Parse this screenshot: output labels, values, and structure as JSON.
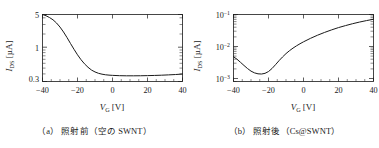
{
  "figure": {
    "panels": [
      {
        "id": "a",
        "caption_tag": "（a）",
        "caption_text": "照射前（空の SWNT）",
        "chart_data": {
          "type": "line",
          "title": "",
          "xlabel": "V_G [V]",
          "ylabel": "I_DS [µA]",
          "xlabel_main": "V",
          "xlabel_sub": "G",
          "xlabel_unit": "[V]",
          "ylabel_main": "I",
          "ylabel_sub": "DS",
          "ylabel_unit": "[µA]",
          "yscale": "log",
          "xscale": "linear",
          "xlim": [
            -40,
            40
          ],
          "ylim": [
            0.3,
            5
          ],
          "xticks": [
            -40,
            -20,
            0,
            20,
            40
          ],
          "xticklabels": [
            "-40",
            "-20",
            "0",
            "20",
            "40"
          ],
          "yticks": [
            0.3,
            1,
            5
          ],
          "yticklabels": [
            "0.3",
            "1",
            "5"
          ],
          "grid": false,
          "legend": "none",
          "x": [
            -40,
            -38,
            -36,
            -34,
            -32,
            -30,
            -28,
            -26,
            -24,
            -22,
            -20,
            -18,
            -16,
            -14,
            -12,
            -10,
            -8,
            -6,
            -4,
            -2,
            0,
            4,
            8,
            12,
            16,
            20,
            24,
            28,
            32,
            36,
            40
          ],
          "y": [
            5.0,
            4.75,
            4.4,
            4.0,
            3.5,
            2.95,
            2.4,
            1.9,
            1.48,
            1.16,
            0.92,
            0.75,
            0.63,
            0.545,
            0.485,
            0.448,
            0.423,
            0.408,
            0.398,
            0.392,
            0.388,
            0.383,
            0.381,
            0.381,
            0.382,
            0.384,
            0.387,
            0.391,
            0.396,
            0.402,
            0.41
          ]
        }
      },
      {
        "id": "b",
        "caption_tag": "（b）",
        "caption_text": "照射後（Cs@SWNT）",
        "chart_data": {
          "type": "line",
          "title": "",
          "xlabel": "V_G [V]",
          "ylabel": "I_DS [µA]",
          "xlabel_main": "V",
          "xlabel_sub": "G",
          "xlabel_unit": "[V]",
          "ylabel_main": "I",
          "ylabel_sub": "DS",
          "ylabel_unit": "[µA]",
          "yscale": "log",
          "xscale": "linear",
          "xlim": [
            -40,
            40
          ],
          "ylim": [
            0.0008,
            0.2
          ],
          "xticks": [
            -40,
            -20,
            0,
            20,
            40
          ],
          "xticklabels": [
            "-40",
            "-20",
            "0",
            "20",
            "40"
          ],
          "yticks": [
            0.001,
            0.01,
            0.1
          ],
          "yticklabels": [
            "10⁻³",
            "10⁻²",
            "10⁻¹"
          ],
          "ytick_exponents": [
            "-3",
            "-2",
            "-1"
          ],
          "ytick_mantissa": "10",
          "grid": false,
          "legend": "none",
          "x": [
            -40,
            -38,
            -36,
            -34,
            -32,
            -30,
            -28,
            -26,
            -24,
            -22,
            -20,
            -18,
            -16,
            -14,
            -12,
            -10,
            -8,
            -6,
            -4,
            -2,
            0,
            4,
            8,
            12,
            16,
            20,
            24,
            28,
            32,
            36,
            40
          ],
          "y": [
            0.0048,
            0.004,
            0.0032,
            0.00255,
            0.00205,
            0.0017,
            0.0015,
            0.0014,
            0.00138,
            0.00145,
            0.00165,
            0.00205,
            0.0027,
            0.0036,
            0.0047,
            0.006,
            0.0074,
            0.0089,
            0.0105,
            0.0122,
            0.014,
            0.018,
            0.0225,
            0.0275,
            0.033,
            0.039,
            0.045,
            0.0515,
            0.058,
            0.0645,
            0.071
          ]
        }
      }
    ]
  }
}
